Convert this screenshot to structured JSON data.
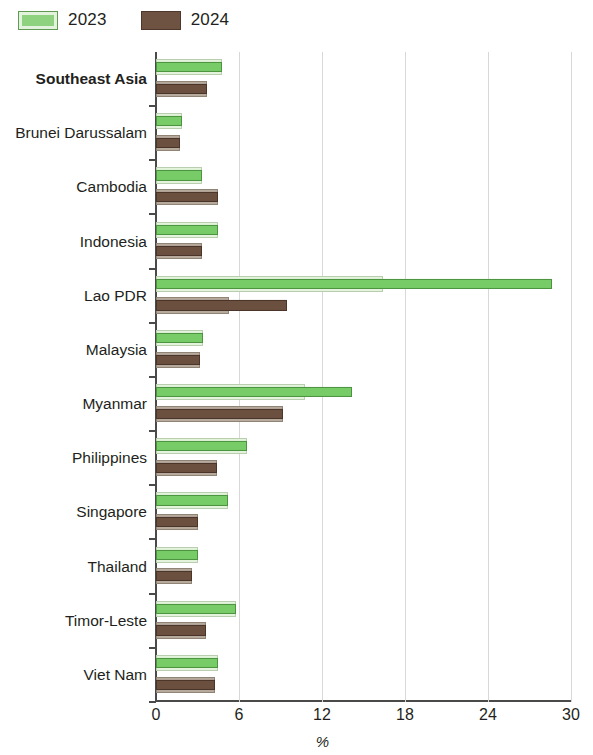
{
  "legend": {
    "items": [
      {
        "label": "2023",
        "color": "#78cc67",
        "key": "2023"
      },
      {
        "label": "2024",
        "color": "#6b5040",
        "key": "2024"
      }
    ]
  },
  "axis": {
    "x_title": "%",
    "x_ticks": [
      "0",
      "6",
      "12",
      "18",
      "24",
      "30"
    ]
  },
  "chart_data": {
    "type": "bar",
    "orientation": "horizontal",
    "title": "",
    "subtitle": "",
    "xlabel": "%",
    "ylabel": "",
    "xlim": [
      0,
      30
    ],
    "xticks": [
      0,
      6,
      12,
      18,
      24,
      30
    ],
    "grid": "vertical",
    "legend_position": "top-left",
    "categories": [
      "Southeast Asia",
      "Brunei Darussalam",
      "Cambodia",
      "Indonesia",
      "Lao PDR",
      "Malaysia",
      "Myanmar",
      "Philippines",
      "Singapore",
      "Thailand",
      "Timor-Leste",
      "Viet Nam"
    ],
    "highlight_category": "Southeast Asia",
    "series": [
      {
        "name": "2023",
        "color": "#78cc67",
        "values": [
          4.8,
          1.9,
          3.3,
          4.5,
          28.6,
          3.4,
          14.2,
          6.6,
          5.2,
          3.0,
          5.8,
          4.5
        ]
      },
      {
        "name": "2024",
        "color": "#6b5040",
        "values": [
          3.7,
          1.7,
          4.5,
          3.3,
          9.5,
          3.2,
          9.2,
          4.4,
          3.0,
          2.6,
          3.6,
          4.3
        ]
      }
    ],
    "halo_values": {
      "2023": [
        4.8,
        1.9,
        3.3,
        4.5,
        16.4,
        3.4,
        10.8,
        6.6,
        5.2,
        3.0,
        5.8,
        4.5
      ],
      "2024": [
        3.7,
        1.7,
        4.5,
        3.3,
        5.3,
        3.2,
        9.2,
        4.4,
        3.0,
        2.6,
        3.6,
        4.3
      ]
    }
  }
}
